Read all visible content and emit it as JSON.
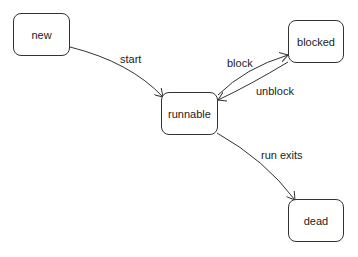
{
  "diagram": {
    "type": "state-diagram",
    "nodes": [
      {
        "id": "new",
        "label": "new"
      },
      {
        "id": "runnable",
        "label": "runnable"
      },
      {
        "id": "blocked",
        "label": "blocked"
      },
      {
        "id": "dead",
        "label": "dead"
      }
    ],
    "edges": [
      {
        "from": "new",
        "to": "runnable",
        "label": "start"
      },
      {
        "from": "runnable",
        "to": "blocked",
        "label": "block"
      },
      {
        "from": "blocked",
        "to": "runnable",
        "label": "unblock"
      },
      {
        "from": "runnable",
        "to": "dead",
        "label": "run exits"
      }
    ],
    "colors": {
      "stroke": "#333333",
      "background": "#ffffff",
      "text": "#222222"
    }
  }
}
